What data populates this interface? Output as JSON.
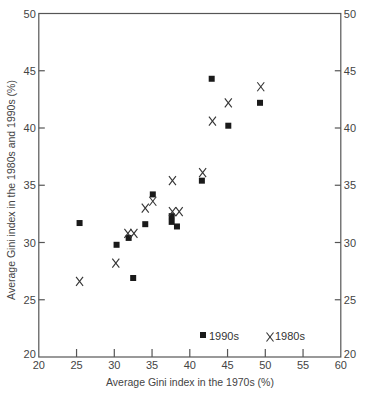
{
  "chart_data": {
    "type": "scatter",
    "title": "",
    "xlabel": "Average Gini index in the 1970s (%)",
    "ylabel": "Average Gini index in the 1980s and 1990s (%)",
    "xlim": [
      20,
      60
    ],
    "ylim": [
      20,
      50
    ],
    "xticks": [
      20,
      25,
      30,
      35,
      40,
      45,
      50,
      55,
      60
    ],
    "yticks": [
      20,
      25,
      30,
      35,
      40,
      45,
      50
    ],
    "grid": false,
    "legend_position": "lower right (inside)",
    "series": [
      {
        "name": "1990s",
        "marker": "square",
        "color": "#1a1a1a",
        "points": [
          [
            25.4,
            31.7
          ],
          [
            30.3,
            29.8
          ],
          [
            31.9,
            30.4
          ],
          [
            32.5,
            26.9
          ],
          [
            34.1,
            31.6
          ],
          [
            35.1,
            34.2
          ],
          [
            37.6,
            32.3
          ],
          [
            37.6,
            31.8
          ],
          [
            38.3,
            31.4
          ],
          [
            41.6,
            35.4
          ],
          [
            42.9,
            44.3
          ],
          [
            45.1,
            40.2
          ],
          [
            49.3,
            42.2
          ]
        ]
      },
      {
        "name": "1980s",
        "marker": "x",
        "color": "#333333",
        "points": [
          [
            25.4,
            26.6
          ],
          [
            30.2,
            28.2
          ],
          [
            31.8,
            30.8
          ],
          [
            32.6,
            30.8
          ],
          [
            34.1,
            33.0
          ],
          [
            35.1,
            33.6
          ],
          [
            37.7,
            35.4
          ],
          [
            37.7,
            32.7
          ],
          [
            38.6,
            32.7
          ],
          [
            41.7,
            36.1
          ],
          [
            43.0,
            40.6
          ],
          [
            45.1,
            42.2
          ],
          [
            49.4,
            43.6
          ]
        ]
      }
    ]
  },
  "legend": {
    "items": [
      {
        "label": "1990s",
        "marker": "square"
      },
      {
        "label": "1980s",
        "marker": "x"
      }
    ]
  },
  "axes": {
    "x_title": "Average Gini index in the 1970s (%)",
    "y_title": "Average Gini index in the 1980s and 1990s (%)"
  }
}
